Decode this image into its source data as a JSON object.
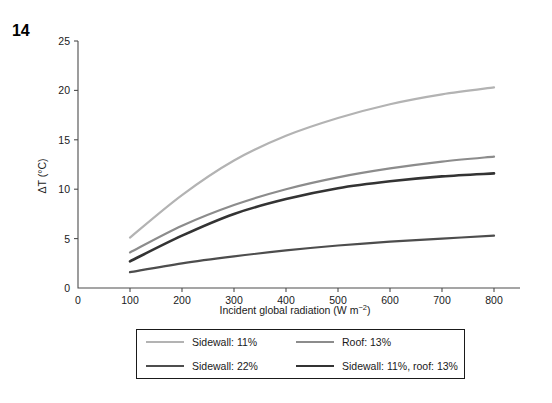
{
  "figure": {
    "number": "14"
  },
  "chart_data": {
    "type": "line",
    "title": "",
    "xlabel": "Incident global radiation (W m",
    "xlabel_unit_exponent": "−2",
    "xlabel_suffix": ")",
    "xlabel_full": "Incident global radiation (W m−2)",
    "ylabel": "ΔT (°C)",
    "xlim": [
      0,
      850
    ],
    "ylim": [
      0,
      25
    ],
    "xticks": [
      0,
      100,
      200,
      300,
      400,
      500,
      600,
      700,
      800
    ],
    "xticklabels": [
      "0",
      "100",
      "200",
      "300",
      "400",
      "500",
      "600",
      "700",
      "800"
    ],
    "yticks": [
      0,
      5,
      10,
      15,
      20,
      25
    ],
    "yticklabels": [
      "0",
      "5",
      "10",
      "15",
      "20",
      "25"
    ],
    "grid": false,
    "legend_position": "below-plot",
    "x": [
      100,
      200,
      300,
      400,
      500,
      600,
      700,
      800
    ],
    "series": [
      {
        "name": "Sidewall: 11%",
        "color": "#b3b3b3",
        "width": 2.2,
        "values": [
          5.1,
          9.4,
          12.9,
          15.4,
          17.2,
          18.6,
          19.6,
          20.3
        ]
      },
      {
        "name": "Roof: 13%",
        "color": "#8c8c8c",
        "width": 2.2,
        "values": [
          3.6,
          6.3,
          8.4,
          10.0,
          11.2,
          12.1,
          12.8,
          13.3
        ]
      },
      {
        "name": "Sidewall: 22%",
        "color": "#4d4d4d",
        "width": 2.2,
        "values": [
          1.6,
          2.5,
          3.2,
          3.8,
          4.3,
          4.7,
          5.0,
          5.3
        ]
      },
      {
        "name": "Sidewall: 11%, roof: 13%",
        "color": "#333333",
        "width": 2.6,
        "values": [
          2.7,
          5.3,
          7.5,
          9.0,
          10.1,
          10.8,
          11.3,
          11.6
        ]
      }
    ]
  },
  "legend": {
    "entries": [
      {
        "label": "Sidewall: 11%",
        "color": "#b3b3b3",
        "width": 2.2
      },
      {
        "label": "Roof: 13%",
        "color": "#8c8c8c",
        "width": 2.2
      },
      {
        "label": "Sidewall: 22%",
        "color": "#4d4d4d",
        "width": 2.2
      },
      {
        "label": "Sidewall: 11%, roof: 13%",
        "color": "#333333",
        "width": 2.6
      }
    ]
  }
}
